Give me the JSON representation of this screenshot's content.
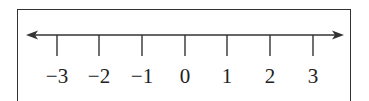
{
  "diagram": {
    "type": "number-line",
    "ticks": [
      {
        "value": -3,
        "label": "−3",
        "x": 57
      },
      {
        "value": -2,
        "label": "−2",
        "x": 99
      },
      {
        "value": -1,
        "label": "−1",
        "x": 142
      },
      {
        "value": 0,
        "label": "0",
        "x": 185
      },
      {
        "value": 1,
        "label": "1",
        "x": 227
      },
      {
        "value": 2,
        "label": "2",
        "x": 270
      },
      {
        "value": 3,
        "label": "3",
        "x": 313
      }
    ],
    "arrows": [
      "left",
      "right"
    ],
    "line_color": "#333333"
  }
}
